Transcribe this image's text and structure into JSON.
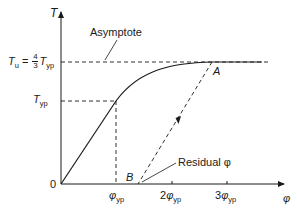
{
  "diagram": {
    "type": "torque-twist curve (elastic-plastic shaft)",
    "axes": {
      "y_label": "T",
      "x_label": "φ",
      "origin_label": "0"
    },
    "y_levels": {
      "tu": {
        "symbol": "T",
        "subscript": "u",
        "equals": "=",
        "frac_num": "4",
        "frac_den": "3",
        "rhs_symbol": "T",
        "rhs_subscript": "yp"
      },
      "typ": {
        "symbol": "T",
        "subscript": "yp"
      }
    },
    "x_ticks": [
      {
        "coef": "",
        "symbol": "φ",
        "subscript": "yp"
      },
      {
        "coef": "2",
        "symbol": "φ",
        "subscript": "yp"
      },
      {
        "coef": "3",
        "symbol": "φ",
        "subscript": "yp"
      }
    ],
    "annotations": {
      "asymptote": "Asymptote",
      "point_a": "A",
      "point_b": "B",
      "residual": "Residual φ"
    },
    "colors": {
      "line": "#1a1a1a",
      "background": "#ffffff"
    }
  }
}
